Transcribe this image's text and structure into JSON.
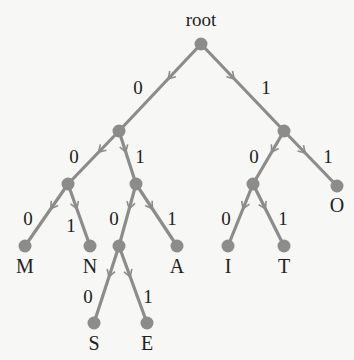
{
  "diagram": {
    "edge_color": "#8c8c8c",
    "node_color": "#8c8c8c",
    "root_label": "root",
    "nodes": [
      {
        "id": "root",
        "x": 201,
        "y": 44,
        "label": "root",
        "lx": 201,
        "ly": 26
      },
      {
        "id": "n0",
        "x": 119,
        "y": 131,
        "label": ""
      },
      {
        "id": "n1",
        "x": 284,
        "y": 131,
        "label": ""
      },
      {
        "id": "n00",
        "x": 68,
        "y": 184,
        "label": ""
      },
      {
        "id": "n01",
        "x": 136,
        "y": 184,
        "label": ""
      },
      {
        "id": "n10",
        "x": 253,
        "y": 184,
        "label": ""
      },
      {
        "id": "O",
        "x": 337,
        "y": 186,
        "label": "O",
        "lx": 337,
        "ly": 212
      },
      {
        "id": "M",
        "x": 25,
        "y": 246,
        "label": "M",
        "lx": 25,
        "ly": 273
      },
      {
        "id": "N",
        "x": 90,
        "y": 246,
        "label": "N",
        "lx": 90,
        "ly": 273
      },
      {
        "id": "n010",
        "x": 119,
        "y": 246,
        "label": ""
      },
      {
        "id": "A",
        "x": 177,
        "y": 246,
        "label": "A",
        "lx": 177,
        "ly": 273
      },
      {
        "id": "I",
        "x": 228,
        "y": 246,
        "label": "I",
        "lx": 228,
        "ly": 273
      },
      {
        "id": "T",
        "x": 284,
        "y": 246,
        "label": "T",
        "lx": 284,
        "ly": 273
      },
      {
        "id": "S",
        "x": 94,
        "y": 323,
        "label": "S",
        "lx": 94,
        "ly": 350
      },
      {
        "id": "E",
        "x": 147,
        "y": 323,
        "label": "E",
        "lx": 147,
        "ly": 350
      }
    ],
    "edges": [
      {
        "from": "root",
        "to": "n0",
        "bit": "0",
        "bx": 138,
        "by": 94
      },
      {
        "from": "root",
        "to": "n1",
        "bit": "1",
        "bx": 266,
        "by": 94
      },
      {
        "from": "n0",
        "to": "n00",
        "bit": "0",
        "bx": 74,
        "by": 163
      },
      {
        "from": "n0",
        "to": "n01",
        "bit": "1",
        "bx": 140,
        "by": 163
      },
      {
        "from": "n1",
        "to": "n10",
        "bit": "0",
        "bx": 254,
        "by": 163
      },
      {
        "from": "n1",
        "to": "O",
        "bit": "1",
        "bx": 328,
        "by": 163
      },
      {
        "from": "n00",
        "to": "M",
        "bit": "0",
        "bx": 28,
        "by": 225
      },
      {
        "from": "n00",
        "to": "N",
        "bit": "1",
        "bx": 71,
        "by": 232
      },
      {
        "from": "n01",
        "to": "n010",
        "bit": "0",
        "bx": 114,
        "by": 225
      },
      {
        "from": "n01",
        "to": "A",
        "bit": "1",
        "bx": 172,
        "by": 225
      },
      {
        "from": "n10",
        "to": "I",
        "bit": "0",
        "bx": 226,
        "by": 225
      },
      {
        "from": "n10",
        "to": "T",
        "bit": "1",
        "bx": 283,
        "by": 225
      },
      {
        "from": "n010",
        "to": "S",
        "bit": "0",
        "bx": 88,
        "by": 303
      },
      {
        "from": "n010",
        "to": "E",
        "bit": "1",
        "bx": 148,
        "by": 303
      }
    ]
  }
}
